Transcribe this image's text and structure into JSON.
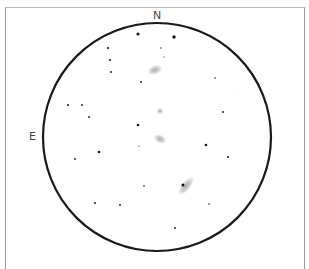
{
  "sketch": {
    "orientation_labels": {
      "north": "N",
      "east": "E"
    },
    "field_of_view": {
      "cx": 157,
      "cy": 137,
      "r": 114,
      "stroke": "#1a1a1a"
    },
    "stars": [
      {
        "x": 138,
        "y": 34,
        "r": 1.6
      },
      {
        "x": 174,
        "y": 37,
        "r": 1.7
      },
      {
        "x": 108,
        "y": 48,
        "r": 1.1
      },
      {
        "x": 161,
        "y": 48,
        "r": 0.7
      },
      {
        "x": 110,
        "y": 60,
        "r": 1.1
      },
      {
        "x": 164,
        "y": 57,
        "r": 0.6
      },
      {
        "x": 111,
        "y": 72,
        "r": 1.0
      },
      {
        "x": 141,
        "y": 82,
        "r": 0.9
      },
      {
        "x": 215,
        "y": 78,
        "r": 0.8
      },
      {
        "x": 68,
        "y": 105,
        "r": 1.0
      },
      {
        "x": 82,
        "y": 105,
        "r": 0.9
      },
      {
        "x": 89,
        "y": 117,
        "r": 0.9
      },
      {
        "x": 223,
        "y": 112,
        "r": 1.0
      },
      {
        "x": 138,
        "y": 125,
        "r": 1.3
      },
      {
        "x": 206,
        "y": 145,
        "r": 1.3
      },
      {
        "x": 99,
        "y": 152,
        "r": 1.3
      },
      {
        "x": 75,
        "y": 159,
        "r": 0.9
      },
      {
        "x": 139,
        "y": 146,
        "r": 0.6
      },
      {
        "x": 228,
        "y": 157,
        "r": 1.0
      },
      {
        "x": 144,
        "y": 186,
        "r": 0.8
      },
      {
        "x": 95,
        "y": 203,
        "r": 1.0
      },
      {
        "x": 120,
        "y": 205,
        "r": 0.9
      },
      {
        "x": 209,
        "y": 204,
        "r": 0.8
      },
      {
        "x": 175,
        "y": 228,
        "r": 0.9
      },
      {
        "x": 238,
        "y": 93,
        "r": 0.5,
        "faint": true
      },
      {
        "x": 236,
        "y": 168,
        "r": 0.5,
        "faint": true
      }
    ],
    "galaxies": [
      {
        "name": "galaxy-north",
        "cx": 155,
        "cy": 70,
        "rx": 8,
        "ry": 5,
        "rot": -20,
        "core": false
      },
      {
        "name": "galaxy-small-center",
        "cx": 160,
        "cy": 111,
        "rx": 3.5,
        "ry": 3.5,
        "rot": 0,
        "core": false
      },
      {
        "name": "galaxy-center",
        "cx": 160,
        "cy": 139,
        "rx": 7,
        "ry": 4.5,
        "rot": 25,
        "core": false
      },
      {
        "name": "galaxy-south-bright",
        "cx": 186,
        "cy": 186,
        "rx": 12,
        "ry": 5,
        "rot": -50,
        "core": true,
        "core_x": 183,
        "core_y": 185
      }
    ]
  }
}
